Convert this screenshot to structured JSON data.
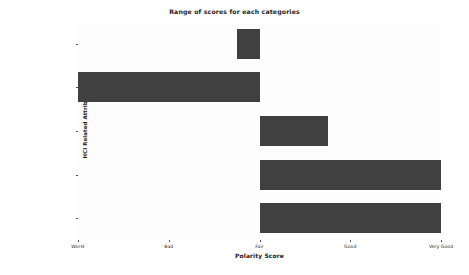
{
  "chart_data": {
    "type": "bar",
    "orientation": "horizontal",
    "bar_style": "range",
    "title": "Range of scores for each categories",
    "xlabel": "Polarity Score",
    "ylabel": "HCI Related Attributes",
    "categories": [
      "productdescription",
      "ProductComparison",
      "Graphics",
      "FontSize",
      "Colors"
    ],
    "x_tick_labels": [
      "Worst",
      "Bad",
      "Fair",
      "Good",
      "Very Good"
    ],
    "x_tick_values": [
      0,
      1,
      2,
      3,
      4
    ],
    "xlim": [
      0,
      4
    ],
    "grid": false,
    "legend": null,
    "bar_color": "#404040",
    "background_color": "#ffffff",
    "ranges": [
      {
        "category": "productdescription",
        "start": 1.75,
        "end": 2.0
      },
      {
        "category": "ProductComparison",
        "start": 0.0,
        "end": 2.0
      },
      {
        "category": "Graphics",
        "start": 2.0,
        "end": 2.75
      },
      {
        "category": "FontSize",
        "start": 2.0,
        "end": 4.0
      },
      {
        "category": "Colors",
        "start": 2.0,
        "end": 4.0
      }
    ],
    "values": [
      0.25,
      2.0,
      0.75,
      2.0,
      2.0
    ]
  },
  "axis": {
    "x_ticks": [
      {
        "label": "Worst"
      },
      {
        "label": "Bad"
      },
      {
        "label": "Fair"
      },
      {
        "label": "Good"
      },
      {
        "label": "Very Good"
      }
    ],
    "y_ticks": [
      {
        "label": "productdescription"
      },
      {
        "label": "ProductComparison"
      },
      {
        "label": "Graphics"
      },
      {
        "label": "FontSize"
      },
      {
        "label": "Colors"
      }
    ]
  }
}
